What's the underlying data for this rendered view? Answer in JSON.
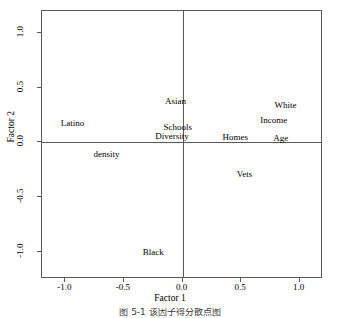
{
  "chart_data": {
    "type": "scatter",
    "title": "",
    "xlabel": "Factor 1",
    "ylabel": "Factor 2",
    "xlim": [
      -1.2,
      1.2
    ],
    "ylim": [
      -1.25,
      1.2
    ],
    "xticks": [
      "-1.0",
      "-0.5",
      "0.0",
      "0.5",
      "1.0"
    ],
    "xtick_values": [
      -1.0,
      -0.5,
      0.0,
      0.5,
      1.0
    ],
    "yticks": [
      "1.0",
      "0.5",
      "0.0",
      "-0.5",
      "-1.0"
    ],
    "ytick_values": [
      1.0,
      0.5,
      0.0,
      -0.5,
      -1.0
    ],
    "grid": false,
    "legend": "none",
    "zero_lines": true,
    "marker": "text-label-only",
    "points": [
      {
        "label": "Latino",
        "x": -0.94,
        "y": 0.18
      },
      {
        "label": "Asian",
        "x": -0.06,
        "y": 0.38
      },
      {
        "label": "Schools",
        "x": -0.04,
        "y": 0.14
      },
      {
        "label": "Diversity",
        "x": -0.09,
        "y": 0.06
      },
      {
        "label": "density",
        "x": -0.65,
        "y": -0.11
      },
      {
        "label": "Homes",
        "x": 0.45,
        "y": 0.05
      },
      {
        "label": "White",
        "x": 0.88,
        "y": 0.34
      },
      {
        "label": "Income",
        "x": 0.78,
        "y": 0.2
      },
      {
        "label": "Age",
        "x": 0.84,
        "y": 0.04
      },
      {
        "label": "Vets",
        "x": 0.53,
        "y": -0.29
      },
      {
        "label": "Black",
        "x": -0.25,
        "y": -1.0
      }
    ]
  },
  "caption": {
    "text": "图 5-1  该因子得分散点图",
    "clipped": true
  },
  "colors": {
    "axis": "#5a5a5a",
    "text": "#000000",
    "background": "#ffffff"
  }
}
